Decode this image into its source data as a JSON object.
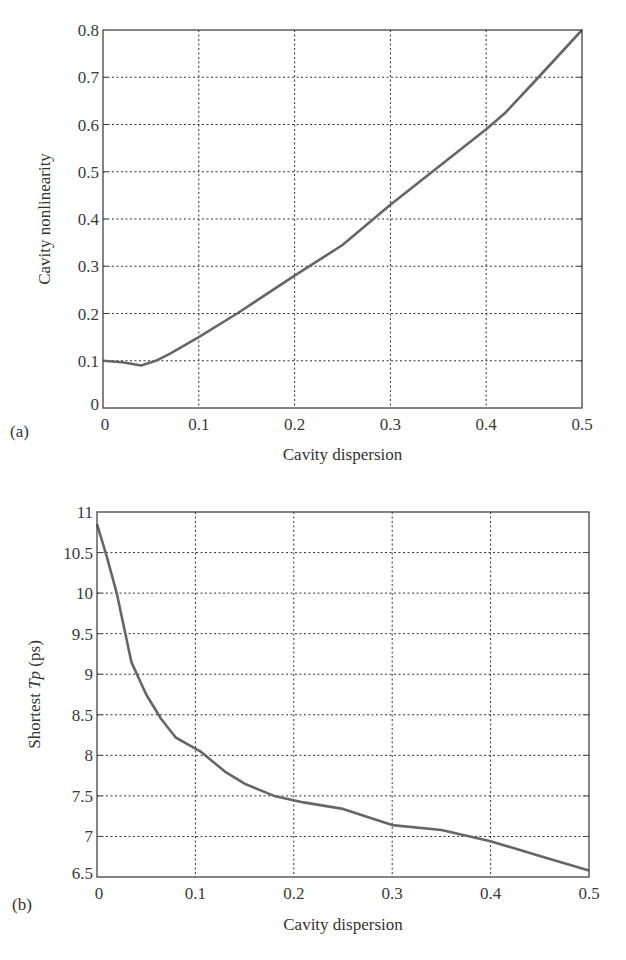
{
  "chart_data": [
    {
      "type": "line",
      "panel_label": "(a)",
      "title": "",
      "xlabel": "Cavity dispersion",
      "ylabel": "Cavity nonlinearity",
      "xlim": [
        0,
        0.5
      ],
      "ylim": [
        0,
        0.8
      ],
      "grid": true,
      "xticks": [
        0,
        0.1,
        0.2,
        0.3,
        0.4,
        0.5
      ],
      "xtick_labels": [
        "0",
        "0.1",
        "0.2",
        "0.3",
        "0.4",
        "0.5"
      ],
      "yticks": [
        0,
        0.1,
        0.2,
        0.3,
        0.4,
        0.5,
        0.6,
        0.7,
        0.8
      ],
      "ytick_labels": [
        "0",
        "0.1",
        "0.2",
        "0.3",
        "0.4",
        "0.5",
        "0.6",
        "0.7",
        "0.8"
      ],
      "series": [
        {
          "name": "nonlinearity",
          "x": [
            0,
            0.02,
            0.04,
            0.055,
            0.07,
            0.1,
            0.14,
            0.2,
            0.25,
            0.3,
            0.35,
            0.4,
            0.42,
            0.45,
            0.5
          ],
          "y": [
            0.1,
            0.097,
            0.09,
            0.1,
            0.115,
            0.15,
            0.2,
            0.28,
            0.345,
            0.43,
            0.51,
            0.59,
            0.625,
            0.69,
            0.8
          ]
        }
      ]
    },
    {
      "type": "line",
      "panel_label": "(b)",
      "title": "",
      "xlabel": "Cavity dispersion",
      "ylabel_prefix": "Shortest ",
      "ylabel_italic": "Tp",
      "ylabel_suffix": " (ps)",
      "xlim": [
        0,
        0.5
      ],
      "ylim": [
        6.5,
        11
      ],
      "grid": true,
      "xticks": [
        0,
        0.1,
        0.2,
        0.3,
        0.4,
        0.5
      ],
      "xtick_labels": [
        "0",
        "0.1",
        "0.2",
        "0.3",
        "0.4",
        "0.5"
      ],
      "yticks": [
        6.5,
        7,
        7.5,
        8,
        8.5,
        9,
        9.5,
        10,
        10.5,
        11
      ],
      "ytick_labels": [
        "6.5",
        "7",
        "7.5",
        "8",
        "8.5",
        "9",
        "9.5",
        "10",
        "10.5",
        "11"
      ],
      "series": [
        {
          "name": "shortest Tp",
          "x": [
            0,
            0.01,
            0.02,
            0.035,
            0.05,
            0.065,
            0.08,
            0.09,
            0.105,
            0.115,
            0.13,
            0.15,
            0.18,
            0.21,
            0.25,
            0.3,
            0.35,
            0.4,
            0.45,
            0.5
          ],
          "y": [
            10.85,
            10.45,
            10.0,
            9.15,
            8.75,
            8.45,
            8.22,
            8.15,
            8.05,
            7.95,
            7.8,
            7.65,
            7.5,
            7.42,
            7.34,
            7.14,
            7.08,
            6.94,
            6.76,
            6.58
          ]
        }
      ]
    }
  ]
}
